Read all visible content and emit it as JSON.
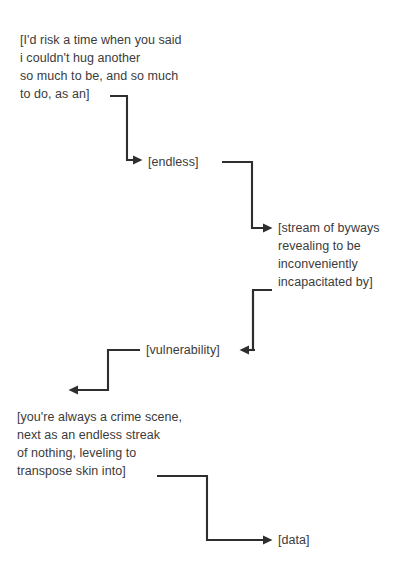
{
  "document": {
    "title": "Poetic flow diagram",
    "background_color": "#ffffff",
    "text_color": "#3b3b3b",
    "line_color": "#2e2e2e"
  },
  "nodes": {
    "block1": {
      "name": "source-passage",
      "lines": [
        "[I'd risk a time when you said",
        "i couldn't hug another",
        "so much to be, and so much",
        "to do, as an]"
      ],
      "text": "[I'd risk a time when you said\ni couldn't hug another\nso much to be, and so much\nto do, as an]"
    },
    "endless": {
      "name": "endless-node",
      "text": "[endless]"
    },
    "stream": {
      "name": "stream-passage",
      "lines": [
        "[stream of byways",
        "revealing to be",
        "inconveniently",
        "incapacitated by]"
      ],
      "text": "[stream of byways\nrevealing to be\ninconveniently\nincapacitated by]"
    },
    "vulnerability": {
      "name": "vulnerability-node",
      "text": "[vulnerability]"
    },
    "crime": {
      "name": "crime-scene-passage",
      "lines": [
        "[you're always a crime scene,",
        "next as an endless streak",
        "of nothing, leveling to",
        "transpose skin into]"
      ],
      "text": "[you're always a crime scene,\nnext as an endless streak\nof nothing, leveling to\ntranspose skin into]"
    },
    "data": {
      "name": "data-node",
      "text": "[data]"
    }
  },
  "connectors": [
    {
      "name": "connector-source-to-endless",
      "from": "block1",
      "to": "endless",
      "direction": "right-down-right",
      "arrow": "right"
    },
    {
      "name": "connector-endless-to-stream",
      "from": "endless",
      "to": "stream",
      "direction": "right-down-right",
      "arrow": "right"
    },
    {
      "name": "connector-stream-to-vulnerability",
      "from": "stream",
      "to": "vulnerability",
      "direction": "left-down-left",
      "arrow": "left"
    },
    {
      "name": "connector-vulnerability-to-crime",
      "from": "vulnerability",
      "to": "crime",
      "direction": "left-down-left",
      "arrow": "left"
    },
    {
      "name": "connector-crime-to-data",
      "from": "crime",
      "to": "data",
      "direction": "right-down-right",
      "arrow": "right"
    }
  ]
}
